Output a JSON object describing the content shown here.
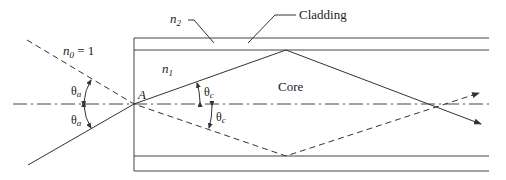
{
  "diagram": {
    "labels": {
      "n0": "n",
      "n0_sub": "0",
      "n0_eq": " = 1",
      "n1": "n",
      "n1_sub": "1",
      "n2": "n",
      "n2_sub": "2",
      "cladding": "Cladding",
      "core": "Core",
      "point_a": "A",
      "theta_a_upper": "θ",
      "theta_a_upper_sub": "a",
      "theta_a_lower": "θ",
      "theta_a_lower_sub": "a",
      "theta_c_upper": "θ",
      "theta_c_upper_sub": "c",
      "theta_c_lower": "θ",
      "theta_c_lower_sub": "c"
    },
    "colors": {
      "line": "#333333",
      "background": "#ffffff"
    }
  }
}
